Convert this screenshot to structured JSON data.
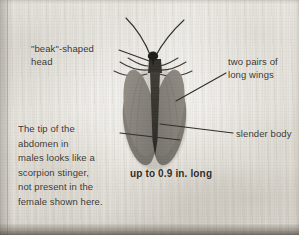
{
  "figure": {
    "caption": "up to 0.9 in. long",
    "background_color": "#e8e6e0",
    "ink_color": "#35312c",
    "wing_color": "#8d8880",
    "body_color": "#4a463f"
  },
  "annotations": [
    {
      "id": "head",
      "text": "\"beak\"-shaped\nhead",
      "target": "head"
    },
    {
      "id": "wings",
      "text": "two pairs of\nlong wings",
      "target": "wing"
    },
    {
      "id": "body",
      "text": "slender body",
      "target": "abdomen"
    },
    {
      "id": "abdomen",
      "text": "The tip of the\nabdomen in\nmales looks like a\nscorpion stinger,\nnot present in the\nfemale shown here.",
      "target": "abdomen-tip"
    }
  ],
  "labels": {
    "head": "\"beak\"-shaped\nhead",
    "wings": "two pairs of\nlong wings",
    "body": "slender body",
    "abdomen": "The tip of the\nabdomen in\nmales looks like a\nscorpion stinger,\nnot present in the\nfemale shown here."
  }
}
